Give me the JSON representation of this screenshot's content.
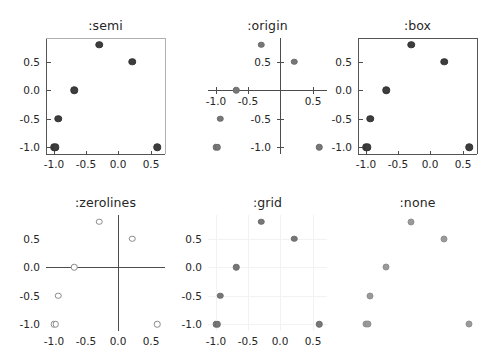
{
  "figure": {
    "width": 485,
    "height": 358,
    "background": "#ffffff",
    "layout": "2 rows x 3 columns of scatter panels"
  },
  "chart_data": [
    {
      "type": "scatter",
      "title": ":semi",
      "frame_style": "semi",
      "xlabel": "",
      "ylabel": "",
      "xlim": [
        -1.12,
        0.72
      ],
      "ylim": [
        -1.12,
        0.92
      ],
      "xticks": [
        -1.0,
        -0.5,
        0.0,
        0.5
      ],
      "xticklabels": [
        "-1.0",
        "-0.5",
        "0.0",
        "0.5"
      ],
      "yticks": [
        0.5,
        0.0,
        -0.5,
        -1.0
      ],
      "yticklabels": [
        "0.5",
        "0.0",
        "-0.5",
        "-1.0"
      ],
      "grid": false,
      "legend": null,
      "marker_style": "dark-filled",
      "marker_color": "#3d3d3d",
      "x": [
        -1.0,
        -0.97,
        -0.93,
        -0.68,
        -0.3,
        0.21,
        0.6
      ],
      "y": [
        -1.0,
        -1.0,
        -0.5,
        0.0,
        0.8,
        0.5,
        -1.0
      ]
    },
    {
      "type": "scatter",
      "title": ":origin",
      "frame_style": "origin",
      "xlabel": "",
      "ylabel": "",
      "xlim": [
        -1.12,
        0.72
      ],
      "ylim": [
        -1.12,
        0.92
      ],
      "xticks": [
        -1.0,
        -0.5,
        0.0,
        0.5
      ],
      "xticklabels": [
        "-1.0",
        "-0.5",
        "0.5"
      ],
      "yticks": [
        0.5,
        -0.5,
        -1.0
      ],
      "yticklabels": [
        "0.5",
        "-0.5",
        "-1.0"
      ],
      "grid": false,
      "legend": null,
      "marker_style": "mid-filled",
      "marker_color": "#777777",
      "x": [
        -1.0,
        -0.97,
        -0.93,
        -0.68,
        -0.3,
        0.21,
        0.6
      ],
      "y": [
        -1.0,
        -1.0,
        -0.5,
        0.0,
        0.8,
        0.5,
        -1.0
      ]
    },
    {
      "type": "scatter",
      "title": ":box",
      "frame_style": "box",
      "xlabel": "",
      "ylabel": "",
      "xlim": [
        -1.12,
        0.72
      ],
      "ylim": [
        -1.12,
        0.92
      ],
      "xticks": [
        -1.0,
        -0.5,
        0.0,
        0.5
      ],
      "xticklabels": [
        "-1.0",
        "-0.5",
        "0.0",
        "0.5"
      ],
      "yticks": [
        0.5,
        0.0,
        -0.5,
        -1.0
      ],
      "yticklabels": [
        "0.5",
        "0.0",
        "-0.5",
        "-1.0"
      ],
      "grid": false,
      "legend": null,
      "marker_style": "dark-filled",
      "marker_color": "#3d3d3d",
      "x": [
        -1.0,
        -0.97,
        -0.93,
        -0.68,
        -0.3,
        0.21,
        0.6
      ],
      "y": [
        -1.0,
        -1.0,
        -0.5,
        0.0,
        0.8,
        0.5,
        -1.0
      ]
    },
    {
      "type": "scatter",
      "title": ":zerolines",
      "frame_style": "zerolines",
      "xlabel": "",
      "ylabel": "",
      "xlim": [
        -1.12,
        0.72
      ],
      "ylim": [
        -1.12,
        0.92
      ],
      "xticks": [
        -1.0,
        -0.5,
        0.0,
        0.5
      ],
      "xticklabels": [
        "-1.0",
        "-0.5",
        "0.0",
        "0.5"
      ],
      "yticks": [
        0.5,
        0.0,
        -0.5,
        -1.0
      ],
      "yticklabels": [
        "0.5",
        "0.0",
        "-0.5",
        "-1.0"
      ],
      "grid": false,
      "legend": null,
      "marker_style": "hollow",
      "marker_color": "#8a8a8a",
      "x": [
        -1.0,
        -0.97,
        -0.93,
        -0.68,
        -0.3,
        0.21,
        0.6
      ],
      "y": [
        -1.0,
        -1.0,
        -0.5,
        0.0,
        0.8,
        0.5,
        -1.0
      ]
    },
    {
      "type": "scatter",
      "title": ":grid",
      "frame_style": "grid",
      "xlabel": "",
      "ylabel": "",
      "xlim": [
        -1.12,
        0.72
      ],
      "ylim": [
        -1.12,
        0.92
      ],
      "xticks": [
        -1.0,
        -0.5,
        0.0,
        0.5
      ],
      "xticklabels": [
        "-1.0",
        "-0.5",
        "0.0",
        "0.5"
      ],
      "yticks": [
        0.5,
        0.0,
        -0.5,
        -1.0
      ],
      "yticklabels": [
        "0.5",
        "0.0",
        "-0.5",
        "-1.0"
      ],
      "grid": true,
      "legend": null,
      "marker_style": "mid-filled",
      "marker_color": "#777777",
      "x": [
        -1.0,
        -0.97,
        -0.93,
        -0.68,
        -0.3,
        0.21,
        0.6
      ],
      "y": [
        -1.0,
        -1.0,
        -0.5,
        0.0,
        0.8,
        0.5,
        -1.0
      ]
    },
    {
      "type": "scatter",
      "title": ":none",
      "frame_style": "none",
      "xlabel": "",
      "ylabel": "",
      "xlim": [
        -1.12,
        0.72
      ],
      "ylim": [
        -1.12,
        0.92
      ],
      "xticks": [],
      "xticklabels": [],
      "yticks": [],
      "yticklabels": [],
      "grid": false,
      "legend": null,
      "marker_style": "light-ringed",
      "marker_color": "#9a9a9a",
      "x": [
        -1.0,
        -0.97,
        -0.93,
        -0.68,
        -0.3,
        0.21,
        0.6
      ],
      "y": [
        -1.0,
        -1.0,
        -0.5,
        0.0,
        0.8,
        0.5,
        -1.0
      ]
    }
  ],
  "panel_geometry": [
    {
      "left": 46,
      "top": 38,
      "width": 119,
      "height": 116,
      "title_top": 18
    },
    {
      "left": 208,
      "top": 38,
      "width": 119,
      "height": 116,
      "title_top": 18
    },
    {
      "left": 358,
      "top": 38,
      "width": 119,
      "height": 116,
      "title_top": 18
    },
    {
      "left": 46,
      "top": 215,
      "width": 119,
      "height": 116,
      "title_top": 195
    },
    {
      "left": 208,
      "top": 215,
      "width": 119,
      "height": 116,
      "title_top": 195
    },
    {
      "left": 358,
      "top": 215,
      "width": 119,
      "height": 116,
      "title_top": 195
    }
  ],
  "colors": {
    "background": "#ffffff",
    "text": "#262626",
    "frame_light": "#b0b0b0",
    "frame_dark": "#555555",
    "axis": "#4d4d4d",
    "gridline": "#f2f2f2",
    "marker_dark": "#3d3d3d",
    "marker_mid": "#777777",
    "marker_hollow_edge": "#8a8a8a",
    "marker_light": "#9a9a9a"
  }
}
